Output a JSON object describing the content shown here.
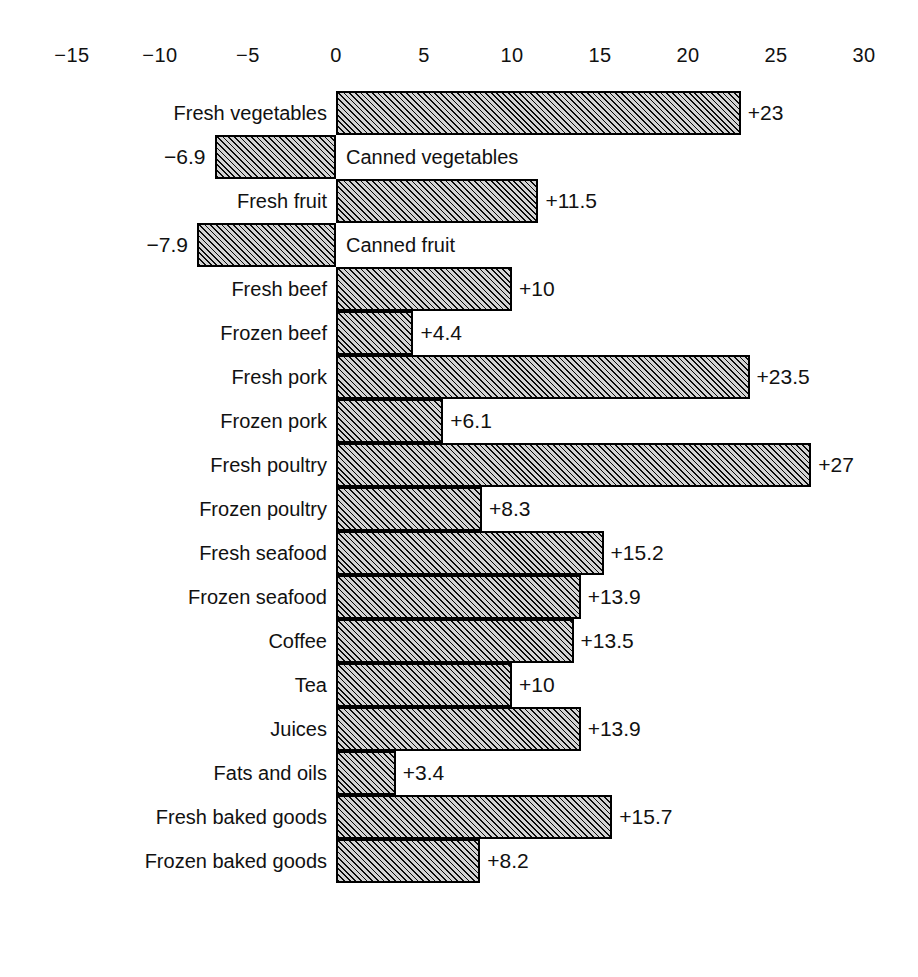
{
  "chart_data": {
    "type": "bar",
    "orientation": "horizontal",
    "title": "",
    "subtitle": "",
    "xlabel": "",
    "ylabel": "",
    "xlim": [
      -15,
      30
    ],
    "grid": false,
    "legend": null,
    "axis_ticks": [
      {
        "value": -15,
        "label": "−15"
      },
      {
        "value": -10,
        "label": "−10"
      },
      {
        "value": -5,
        "label": "−5"
      },
      {
        "value": 0,
        "label": "0"
      },
      {
        "value": 5,
        "label": "5"
      },
      {
        "value": 10,
        "label": "10"
      },
      {
        "value": 15,
        "label": "15"
      },
      {
        "value": 20,
        "label": "20"
      },
      {
        "value": 25,
        "label": "25"
      },
      {
        "value": 30,
        "label": "30"
      }
    ],
    "categories": [
      "Fresh vegetables",
      "Canned vegetables",
      "Fresh fruit",
      "Canned fruit",
      "Fresh beef",
      "Frozen beef",
      "Fresh pork",
      "Frozen pork",
      "Fresh poultry",
      "Frozen poultry",
      "Fresh seafood",
      "Frozen seafood",
      "Coffee",
      "Tea",
      "Juices",
      "Fats and oils",
      "Fresh baked goods",
      "Frozen baked goods"
    ],
    "values": [
      23,
      -6.9,
      11.5,
      -7.9,
      10,
      4.4,
      23.5,
      6.1,
      27,
      8.3,
      15.2,
      13.9,
      13.5,
      10,
      13.9,
      3.4,
      15.7,
      8.2
    ],
    "value_labels": [
      "+23",
      "−6.9",
      "+11.5",
      "−7.9",
      "+10",
      "+4.4",
      "+23.5",
      "+6.1",
      "+27",
      "+8.3",
      "+15.2",
      "+13.9",
      "+13.5",
      "+10",
      "+13.9",
      "+3.4",
      "+15.7",
      "+8.2"
    ],
    "bars": [
      {
        "category": "Fresh vegetables",
        "value": 23,
        "value_label": "+23"
      },
      {
        "category": "Canned vegetables",
        "value": -6.9,
        "value_label": "−6.9"
      },
      {
        "category": "Fresh fruit",
        "value": 11.5,
        "value_label": "+11.5"
      },
      {
        "category": "Canned fruit",
        "value": -7.9,
        "value_label": "−7.9"
      },
      {
        "category": "Fresh beef",
        "value": 10,
        "value_label": "+10"
      },
      {
        "category": "Frozen beef",
        "value": 4.4,
        "value_label": "+4.4"
      },
      {
        "category": "Fresh pork",
        "value": 23.5,
        "value_label": "+23.5"
      },
      {
        "category": "Frozen pork",
        "value": 6.1,
        "value_label": "+6.1"
      },
      {
        "category": "Fresh poultry",
        "value": 27,
        "value_label": "+27"
      },
      {
        "category": "Frozen poultry",
        "value": 8.3,
        "value_label": "+8.3"
      },
      {
        "category": "Fresh seafood",
        "value": 15.2,
        "value_label": "+15.2"
      },
      {
        "category": "Frozen seafood",
        "value": 13.9,
        "value_label": "+13.9"
      },
      {
        "category": "Coffee",
        "value": 13.5,
        "value_label": "+13.5"
      },
      {
        "category": "Tea",
        "value": 10,
        "value_label": "+10"
      },
      {
        "category": "Juices",
        "value": 13.9,
        "value_label": "+13.9"
      },
      {
        "category": "Fats and oils",
        "value": 3.4,
        "value_label": "+3.4"
      },
      {
        "category": "Fresh baked goods",
        "value": 15.7,
        "value_label": "+15.7"
      },
      {
        "category": "Frozen baked goods",
        "value": 8.2,
        "value_label": "+8.2"
      }
    ],
    "colors": {
      "bar_fill": "#d3d3d3",
      "bar_hatch": "#000000",
      "bar_border": "#000000",
      "text": "#111111",
      "background": "#ffffff"
    }
  },
  "geometry": {
    "zero_x": 336,
    "px_per_unit": 17.6,
    "bar_height": 44,
    "first_bar_top": 91,
    "axis_label_top": 44
  }
}
